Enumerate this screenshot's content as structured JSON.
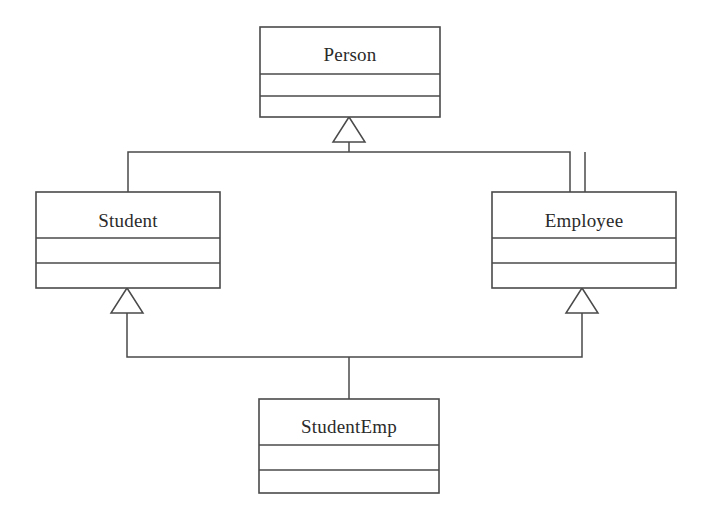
{
  "diagram": {
    "kind": "uml-class-diagram",
    "background_color": "#ffffff",
    "line_color": "#4a4a4a",
    "text_color": "#2b2b2b",
    "classes": [
      {
        "id": "person",
        "name": "Person",
        "x": 260,
        "y": 27,
        "width": 180,
        "height": 90,
        "name_baseline_y": 61,
        "dividers": [
          74,
          96
        ],
        "compartments": [
          "Person",
          "",
          ""
        ]
      },
      {
        "id": "student",
        "name": "Student",
        "x": 36,
        "y": 192,
        "width": 184,
        "height": 96,
        "name_baseline_y": 227,
        "dividers": [
          238,
          263
        ],
        "compartments": [
          "Student",
          "",
          ""
        ]
      },
      {
        "id": "employee",
        "name": "Employee",
        "x": 492,
        "y": 192,
        "width": 184,
        "height": 96,
        "name_baseline_y": 227,
        "dividers": [
          238,
          263
        ],
        "compartments": [
          "Employee",
          "",
          ""
        ]
      },
      {
        "id": "studentemp",
        "name": "StudentEmp",
        "x": 259,
        "y": 399,
        "width": 180,
        "height": 94,
        "name_baseline_y": 433,
        "dividers": [
          445,
          470
        ],
        "compartments": [
          "StudentEmp",
          "",
          ""
        ]
      }
    ],
    "generalizations": [
      {
        "id": "student-to-person",
        "from": "Student",
        "to": "Person",
        "arrow_apex_x": 349,
        "arrow_apex_y": 117,
        "arrow_half_width": 16,
        "arrow_height": 25,
        "path": "M 128 192 L 128 152 L 570 152 L 570 192",
        "stem": "M 349 152 L 349 142"
      },
      {
        "id": "employee-to-person",
        "from": "Employee",
        "to": "Person",
        "shares_arrow_with": "student-to-person",
        "path": "M 585 192 L 585 152"
      },
      {
        "id": "studentemp-to-student",
        "from": "StudentEmp",
        "to": "Student",
        "arrow_apex_x": 127,
        "arrow_apex_y": 288,
        "arrow_half_width": 16,
        "arrow_height": 25,
        "path": "M 127 313 L 127 357 L 582 357 L 582 313"
      },
      {
        "id": "studentemp-to-employee",
        "from": "StudentEmp",
        "to": "Employee",
        "arrow_apex_x": 582,
        "arrow_apex_y": 288,
        "arrow_half_width": 16,
        "arrow_height": 25
      },
      {
        "id": "studentemp-stem",
        "from": "StudentEmp",
        "to": "junction",
        "path": "M 349 357 L 349 399"
      }
    ]
  }
}
